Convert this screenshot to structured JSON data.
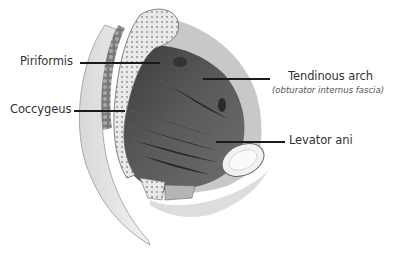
{
  "figure": {
    "labels": [
      {
        "id": "piriformis",
        "text": "Piriformis"
      },
      {
        "id": "coccygeus",
        "text": "Coccygeus"
      },
      {
        "id": "tendinous-arch",
        "text": "Tendinous arch",
        "subtitle": "(obturator internus fascia)"
      },
      {
        "id": "levator-ani",
        "text": "Levator ani"
      }
    ]
  }
}
